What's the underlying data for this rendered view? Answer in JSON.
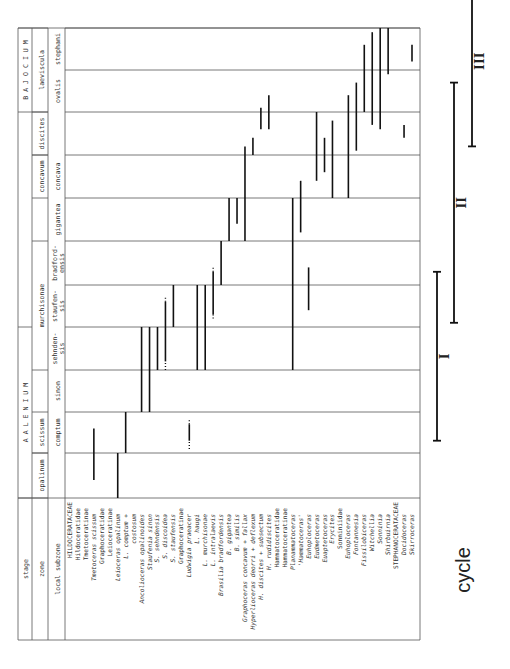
{
  "chart_data": {
    "type": "table",
    "orientation": "rotated-90-ccw",
    "header_labels": {
      "stage": "stage",
      "zone": "zone",
      "subzone": "local subzone"
    },
    "stages": [
      {
        "name": "A A L E N I U M",
        "from_subzone": 0,
        "to_subzone": 3
      },
      {
        "name": "B A J O C I U M",
        "from_subzone": 9,
        "to_subzone": 10
      }
    ],
    "zones": [
      {
        "name": "opalinum",
        "from_subzone": 0,
        "to_subzone": 0
      },
      {
        "name": "scissum",
        "from_subzone": 1,
        "to_subzone": 1
      },
      {
        "name": "murchisonae",
        "from_subzone": 3,
        "to_subzone": 5
      },
      {
        "name": "concavum",
        "from_subzone": 7,
        "to_subzone": 7
      },
      {
        "name": "discites",
        "from_subzone": 8,
        "to_subzone": 8
      },
      {
        "name": "laeviscula",
        "from_subzone": 9,
        "to_subzone": 10
      }
    ],
    "subzones": [
      "",
      "comptum",
      "sinon",
      "sehnden-sis",
      "staufen-sis",
      "bradford-ensis",
      "gigantea",
      "concava",
      "",
      "ovalis",
      "stephani"
    ],
    "taxa": [
      {
        "label": "HILDOCERATACEAE",
        "style": "upper",
        "range": null
      },
      {
        "label": "Hildoceratidae",
        "style": "normal",
        "range": null
      },
      {
        "label": "Tmetoceratinae",
        "style": "normal",
        "range": null
      },
      {
        "label": "Tmetoceras scissum",
        "style": "italic",
        "range": [
          0.4,
          1.6
        ]
      },
      {
        "label": "Graphoceratidae",
        "style": "normal",
        "range": null
      },
      {
        "label": "Leioceratinae",
        "style": "normal",
        "range": null
      },
      {
        "label": "Leioceras opalinum",
        "style": "italic",
        "range": [
          0,
          1
        ]
      },
      {
        "label": "L. comptum +",
        "style": "italic",
        "range": [
          1,
          2
        ]
      },
      {
        "label": "costosum",
        "style": "italic",
        "range": null
      },
      {
        "label": "Ancolioceras opalinoides",
        "style": "italic",
        "range": [
          2,
          4
        ]
      },
      {
        "label": "Staufenia sinon",
        "style": "italic",
        "range": [
          2,
          4
        ]
      },
      {
        "label": "S. sehndensis",
        "style": "italic",
        "range": [
          3,
          4
        ]
      },
      {
        "label": "S. discoidea",
        "style": "italic",
        "range": [
          3.2,
          4.6
        ],
        "dotted_ends": [
          3,
          4.7
        ]
      },
      {
        "label": "S. staufensis",
        "style": "italic",
        "range": [
          4,
          5
        ]
      },
      {
        "label": "Graphoceratinae",
        "style": "normal",
        "range": null
      },
      {
        "label": "Ludwigia praeacer",
        "style": "italic",
        "range": [
          1.3,
          1.7
        ],
        "dotted_ends": [
          1.1,
          1.8
        ]
      },
      {
        "label": "L. haugi",
        "style": "italic",
        "range": [
          3,
          5
        ]
      },
      {
        "label": "L. murchisonae",
        "style": "italic",
        "range": [
          3,
          5
        ]
      },
      {
        "label": "L. intralaevis",
        "style": "italic",
        "range": [
          4.3,
          5.3
        ],
        "dotted_ends": [
          4.2,
          5.4
        ]
      },
      {
        "label": "Brasilia bradfordensis",
        "style": "italic",
        "range": [
          5,
          6
        ]
      },
      {
        "label": "B. gigantea",
        "style": "italic",
        "range": [
          6,
          7
        ]
      },
      {
        "label": "B. similis",
        "style": "italic",
        "range": [
          6.4,
          7
        ]
      },
      {
        "label": "Graphoceras concavum + fallax",
        "style": "italic",
        "range": [
          6,
          8.2
        ]
      },
      {
        "label": "Hyperlioceras deorri + deflexum",
        "style": "italic",
        "range": [
          8,
          8.4
        ]
      },
      {
        "label": "H. discites + subsectum",
        "style": "italic",
        "range": [
          8.6,
          9.1
        ]
      },
      {
        "label": "H. rudidiscites",
        "style": "italic",
        "range": [
          8.6,
          9.4
        ]
      },
      {
        "label": "Hammatoceratidae",
        "style": "normal",
        "range": null
      },
      {
        "label": "Hammatoceratinae",
        "style": "normal",
        "range": null
      },
      {
        "label": "Planammatoceras",
        "style": "italic",
        "range": [
          3,
          7
        ]
      },
      {
        "label": "'Hammatoceras'",
        "style": "italic",
        "range": [
          6.2,
          7.4
        ]
      },
      {
        "label": "Euhoploceras",
        "style": "italic",
        "range": [
          4.4,
          5.4
        ]
      },
      {
        "label": "Eudmetoceras",
        "style": "italic",
        "range": [
          7.4,
          9
        ]
      },
      {
        "label": "Euaptetoceras",
        "style": "italic",
        "range": [
          7.6,
          8.4
        ]
      },
      {
        "label": "Erycites",
        "style": "italic",
        "range": [
          7,
          8.8
        ]
      },
      {
        "label": "Sonniniidae",
        "style": "normal",
        "range": null
      },
      {
        "label": "Euhoploceras",
        "style": "italic",
        "range": [
          7,
          9.4
        ]
      },
      {
        "label": "Fontannesia",
        "style": "italic",
        "range": [
          8.1,
          9.7
        ]
      },
      {
        "label": "Fissilobiceras",
        "style": "italic",
        "range": [
          9,
          10.6
        ]
      },
      {
        "label": "Witchellia",
        "style": "italic",
        "range": [
          8.7,
          10.9
        ]
      },
      {
        "label": "Sonninia",
        "style": "italic",
        "range": [
          8.6,
          11
        ]
      },
      {
        "label": "Shirbuirnia",
        "style": "italic",
        "range": [
          9.9,
          11
        ]
      },
      {
        "label": "STEPHANOCERATACEAE",
        "style": "upper",
        "range": null
      },
      {
        "label": "Docidoceras",
        "style": "italic",
        "range": [
          8.4,
          8.7
        ]
      },
      {
        "label": "Skirroceras",
        "style": "italic",
        "range": [
          10.2,
          10.6
        ]
      }
    ],
    "cycles": [
      {
        "label": "I",
        "from": 1.3,
        "to": 5.3
      },
      {
        "label": "II",
        "from": 4.1,
        "to": 9.7
      },
      {
        "label": "III",
        "from": 8.2,
        "to": 12.3
      }
    ],
    "cycle_title": "cycle"
  }
}
